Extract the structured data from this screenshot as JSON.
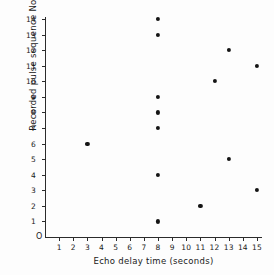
{
  "chart_data": {
    "type": "scatter",
    "title": "",
    "xlabel": "Echo delay time (seconds)",
    "ylabel": "Recorded pulse sequence No",
    "xlim": [
      0,
      15
    ],
    "ylim": [
      0,
      14
    ],
    "grid": false,
    "legend": null,
    "origin_label": "O",
    "x_ticks": [
      1,
      2,
      3,
      4,
      5,
      6,
      7,
      8,
      9,
      10,
      11,
      12,
      13,
      14,
      15
    ],
    "y_ticks": [
      1,
      2,
      3,
      4,
      5,
      6,
      7,
      8,
      9,
      10,
      11,
      12,
      13,
      14
    ],
    "x_tick_labels": [
      "1",
      "2",
      "3",
      "4",
      "5",
      "6",
      "7",
      "8",
      "9",
      "10",
      "11",
      "12",
      "13",
      "14",
      "15"
    ],
    "y_tick_labels": [
      "1",
      "2",
      "3",
      "4",
      "5",
      "6",
      "7",
      "8",
      "9",
      "10",
      "11",
      "12",
      "13",
      "14"
    ],
    "marker": {
      "shape": "circle",
      "color": "#141414",
      "size": 4
    },
    "points": [
      {
        "x": 8,
        "y": 1
      },
      {
        "x": 11,
        "y": 2
      },
      {
        "x": 15,
        "y": 3
      },
      {
        "x": 8,
        "y": 4
      },
      {
        "x": 13,
        "y": 5
      },
      {
        "x": 3,
        "y": 6
      },
      {
        "x": 8,
        "y": 7
      },
      {
        "x": 8,
        "y": 8
      },
      {
        "x": 8,
        "y": 9
      },
      {
        "x": 12,
        "y": 10
      },
      {
        "x": 15,
        "y": 11
      },
      {
        "x": 13,
        "y": 12
      },
      {
        "x": 8,
        "y": 13
      },
      {
        "x": 8,
        "y": 14
      }
    ],
    "axis_color": "#2b2b2b",
    "background_color": "#fdfdfd"
  }
}
